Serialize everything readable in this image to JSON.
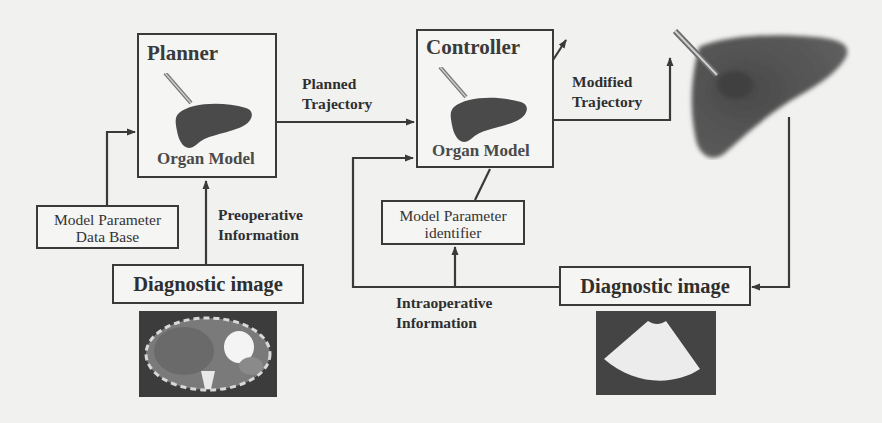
{
  "figure": {
    "planner": {
      "title": "Planner",
      "organ_label": "Organ Model"
    },
    "controller": {
      "title": "Controller",
      "organ_label": "Organ Model"
    },
    "edges": {
      "planned_trajectory": [
        "Planned",
        "Trajectory"
      ],
      "modified_trajectory": [
        "Modified",
        "Trajectory"
      ],
      "preoperative_information": [
        "Preoperative",
        "Information"
      ],
      "intraoperative_information": [
        "Intraoperative",
        "Information"
      ]
    },
    "model_parameter_database": [
      "Model Parameter",
      "Data Base"
    ],
    "model_parameter_identifier": [
      "Model Parameter",
      "identifier"
    ],
    "diagnostic_image_left": {
      "label": "Diagnostic image",
      "image": "ct-scan-image"
    },
    "diagnostic_image_right": {
      "label": "Diagnostic image",
      "image": "ultrasound-image"
    },
    "target_organ": {
      "image": "liver-with-needle"
    },
    "colors": {
      "line": "#3a3a3a",
      "background": "#f1f1ef",
      "organ": "#4a4a4a"
    }
  }
}
